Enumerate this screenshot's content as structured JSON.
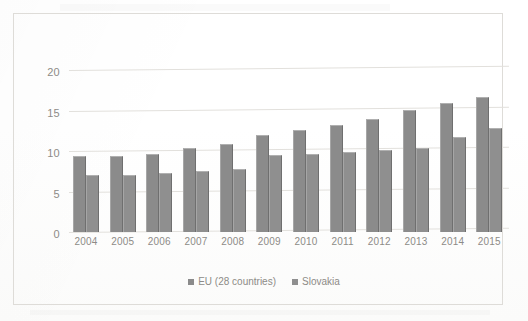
{
  "chart_data": {
    "type": "bar",
    "title": "",
    "subtitle": "",
    "xlabel": "",
    "ylabel": "",
    "categories": [
      "2004",
      "2005",
      "2006",
      "2007",
      "2008",
      "2009",
      "2010",
      "2011",
      "2012",
      "2013",
      "2014",
      "2015"
    ],
    "series": [
      {
        "name": "EU (28 countries)",
        "color": "#8b8b8b",
        "values": [
          9.4,
          9.4,
          9.6,
          10.4,
          10.9,
          12.0,
          12.6,
          13.2,
          14.0,
          15.1,
          16.0,
          16.7
        ]
      },
      {
        "name": "Slovakia",
        "color": "#8f8f8f",
        "values": [
          7.1,
          7.1,
          7.3,
          7.6,
          7.8,
          9.5,
          9.6,
          9.9,
          10.1,
          10.4,
          11.7,
          12.9
        ]
      }
    ],
    "ylim": [
      0,
      22
    ],
    "yticks": [
      0,
      5,
      10,
      15,
      20
    ],
    "ytick_labels": [
      "0",
      "5",
      "10",
      "15",
      "20"
    ],
    "grid": true,
    "legend_position": "bottom"
  },
  "legend": {
    "items": [
      {
        "label": "EU (28 countries)"
      },
      {
        "label": "Slovakia"
      }
    ]
  }
}
